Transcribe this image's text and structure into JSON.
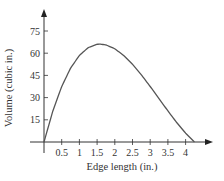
{
  "chart_data": {
    "type": "line",
    "title": "",
    "xlabel": "Edge length (in.)",
    "ylabel": "Volume (cubic in.)",
    "xlim": [
      0,
      4.5
    ],
    "ylim": [
      0,
      80
    ],
    "x_ticks": [
      0.5,
      1,
      1.5,
      2,
      2.5,
      3,
      3.5,
      4
    ],
    "x_tick_labels": [
      "0.5",
      "1",
      "1.5",
      "2",
      "2.5",
      "3",
      "3.5",
      "4"
    ],
    "y_ticks": [
      15,
      30,
      45,
      60,
      75
    ],
    "y_tick_labels": [
      "15",
      "30",
      "45",
      "60",
      "75"
    ],
    "grid": false,
    "legend": null,
    "series": [
      {
        "name": "Volume",
        "x": [
          0,
          0.25,
          0.5,
          0.75,
          1,
          1.25,
          1.5,
          1.585,
          1.75,
          2,
          2.25,
          2.5,
          2.75,
          3,
          3.25,
          3.5,
          3.75,
          4,
          4.25
        ],
        "values": [
          0,
          21.0,
          37.5,
          49.9,
          58.5,
          63.8,
          66.0,
          66.15,
          65.6,
          63.0,
          58.5,
          52.5,
          45.4,
          37.5,
          29.3,
          21.0,
          13.1,
          6.0,
          0
        ]
      }
    ],
    "color": "#555555"
  }
}
